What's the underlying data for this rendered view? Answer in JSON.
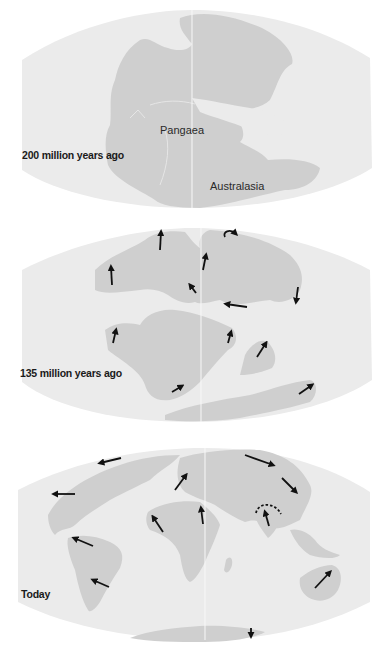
{
  "figure": {
    "colors": {
      "ocean": "#ebebeb",
      "land": "#cfcfcf",
      "arrow": "#111111",
      "meridian": "#f8f8f8",
      "background": "#ffffff"
    },
    "panels": [
      {
        "id": "200mya",
        "label": "200 million years ago",
        "region_labels": [
          "Pangaea",
          "Australasia"
        ],
        "arrows": 0
      },
      {
        "id": "135mya",
        "label": "135 million years ago",
        "region_labels": [],
        "arrows": 13
      },
      {
        "id": "today",
        "label": "Today",
        "region_labels": [],
        "arrows": 13,
        "annotations": [
          "dashed collision arc (India–Himalaya)"
        ]
      }
    ]
  }
}
